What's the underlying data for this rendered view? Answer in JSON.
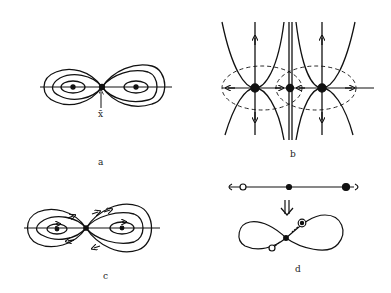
{
  "figure": {
    "panels": [
      {
        "id": "a",
        "label": "a",
        "annotation": "x̄",
        "description": "Figure-eight level curves with two centers and a saddle point"
      },
      {
        "id": "b",
        "label": "b",
        "description": "Phase portrait with two nodes and a saddle, dashed ellipses"
      },
      {
        "id": "c",
        "label": "c",
        "description": "Figure-eight orbits with direction arrows"
      },
      {
        "id": "d",
        "label": "d",
        "description": "Line with fixed points mapped onto a figure-eight curve"
      }
    ],
    "colors": {
      "ink": "#111111",
      "background": "#ffffff"
    }
  }
}
